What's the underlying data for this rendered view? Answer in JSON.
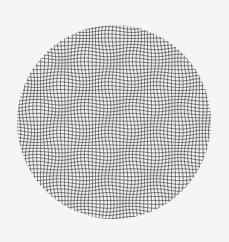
{
  "figure": {
    "background_color": "#f5f5f4",
    "line_color": "#4a4a4a",
    "circle": {
      "cx": 114,
      "cy": 122,
      "r": 97
    },
    "grid": {
      "spacing": 3.45,
      "line_width": 0.8
    },
    "warp": {
      "amplitude": 1.3,
      "wavelength": 48
    }
  }
}
